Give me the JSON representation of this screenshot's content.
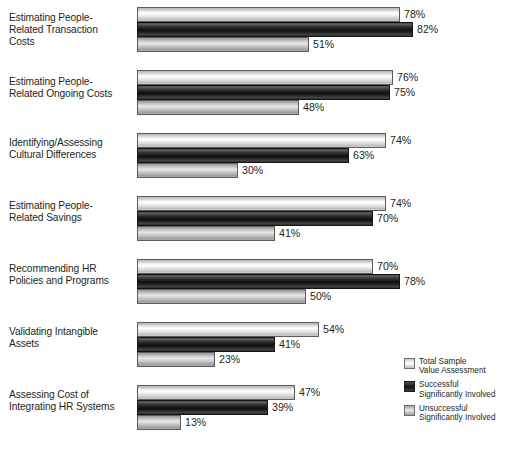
{
  "chart_data": {
    "type": "bar",
    "orientation": "horizontal",
    "title": "",
    "subtitle": "",
    "xlabel": "",
    "ylabel": "",
    "xlim": [
      0,
      100
    ],
    "grid": false,
    "legend_position": "bottom-right",
    "value_suffix": "%",
    "categories": [
      "Estimating People-Related Transaction Costs",
      "Estimating People-Related Ongoing Costs",
      "Identifying/Assessing Cultural Differences",
      "Estimating People-Related Savings",
      "Recommending HR Policies and Programs",
      "Validating Intangible Assets",
      "Assessing Cost of Integrating HR Systems"
    ],
    "series": [
      {
        "name": "Total Sample Value Assessment",
        "values": [
          78,
          76,
          74,
          74,
          70,
          54,
          47
        ],
        "labels": [
          "78%",
          "76%",
          "74%",
          "74%",
          "70%",
          "54%",
          "47%"
        ],
        "color": "#ededed"
      },
      {
        "name": "Successful Significantly Involved",
        "values": [
          82,
          75,
          63,
          70,
          78,
          41,
          39
        ],
        "labels": [
          "82%",
          "75%",
          "63%",
          "70%",
          "78%",
          "41%",
          "39%"
        ],
        "color": "#1a1a1a"
      },
      {
        "name": "Unsuccessful Significantly Involved",
        "values": [
          51,
          48,
          30,
          41,
          50,
          23,
          13
        ],
        "labels": [
          "51%",
          "48%",
          "30%",
          "41%",
          "50%",
          "23%",
          "13%"
        ],
        "color": "#c4c4c4"
      }
    ]
  },
  "categories_display": [
    {
      "line1": "Estimating People-",
      "line2": "Related Transaction",
      "line3": "Costs"
    },
    {
      "line1": "Estimating People-",
      "line2": "Related Ongoing Costs",
      "line3": ""
    },
    {
      "line1": "Identifying/Assessing",
      "line2": "Cultural Differences",
      "line3": ""
    },
    {
      "line1": "Estimating People-",
      "line2": "Related Savings",
      "line3": ""
    },
    {
      "line1": "Recommending HR",
      "line2": "Policies and Programs",
      "line3": ""
    },
    {
      "line1": "Validating Intangible",
      "line2": "Assets",
      "line3": ""
    },
    {
      "line1": "Assessing Cost of",
      "line2": "Integrating HR Systems",
      "line3": ""
    }
  ],
  "legend": {
    "items": [
      {
        "line1": "Total Sample",
        "line2": "Value Assessment",
        "swatch": "light-gradient-swatch"
      },
      {
        "line1": "Successful",
        "line2": "Significantly Involved",
        "swatch": "dark-gradient-swatch"
      },
      {
        "line1": "Unsuccessful",
        "line2": "Significantly Involved",
        "swatch": "medium-gradient-swatch"
      }
    ]
  },
  "layout": {
    "bar_origin_x": 137,
    "px_per_percent": 3.37,
    "bar_height": 15,
    "group_tops": [
      7,
      70,
      133,
      196,
      259,
      322,
      385
    ],
    "label_tops": [
      12,
      76,
      137,
      200,
      263,
      326,
      389
    ]
  }
}
